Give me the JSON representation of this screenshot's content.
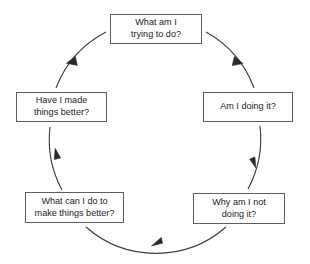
{
  "diagram": {
    "type": "cycle",
    "direction": "clockwise",
    "background_color": "#ffffff",
    "box_border_color": "#5e5e5e",
    "box_fill_color": "#ffffff",
    "text_color": "#1c1c1c",
    "arc_color": "#3a3a3a",
    "nodes": [
      {
        "id": "node-what-am-i-trying-to-do",
        "position": "top",
        "line1": "What am I",
        "line2": "trying to do?",
        "x": 110,
        "y": 14,
        "width": 92,
        "height": 30
      },
      {
        "id": "node-am-i-doing-it",
        "position": "right",
        "line1": "Am I doing it?",
        "line2": "",
        "x": 203,
        "y": 92,
        "width": 90,
        "height": 30
      },
      {
        "id": "node-why-am-i-not-doing-it",
        "position": "bottom-right",
        "line1": "Why am I not",
        "line2": "doing it?",
        "x": 193,
        "y": 193,
        "width": 92,
        "height": 31
      },
      {
        "id": "node-what-can-i-do-to-make-things-better",
        "position": "bottom-left",
        "line1": "What can I do to",
        "line2": "make things better?",
        "x": 25,
        "y": 192,
        "width": 99,
        "height": 31
      },
      {
        "id": "node-have-i-made-things-better",
        "position": "left",
        "line1": "Have I made",
        "line2": "things better?",
        "x": 16,
        "y": 92,
        "width": 91,
        "height": 30
      }
    ],
    "connectors": [
      {
        "id": "connector-top-to-right",
        "from": "node-what-am-i-trying-to-do",
        "to": "node-am-i-doing-it",
        "arrow_direction": "down-right"
      },
      {
        "id": "connector-right-to-bottom-right",
        "from": "node-am-i-doing-it",
        "to": "node-why-am-i-not-doing-it",
        "arrow_direction": "down"
      },
      {
        "id": "connector-bottom-right-to-bottom-left",
        "from": "node-why-am-i-not-doing-it",
        "to": "node-what-can-i-do-to-make-things-better",
        "arrow_direction": "left"
      },
      {
        "id": "connector-bottom-left-to-left",
        "from": "node-what-can-i-do-to-make-things-better",
        "to": "node-have-i-made-things-better",
        "arrow_direction": "up"
      },
      {
        "id": "connector-left-to-top",
        "from": "node-have-i-made-things-better",
        "to": "node-what-am-i-trying-to-do",
        "arrow_direction": "up-right"
      }
    ]
  }
}
